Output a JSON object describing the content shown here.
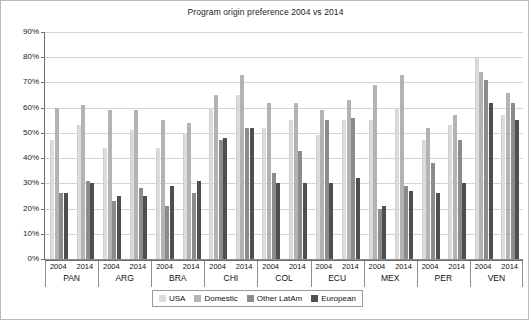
{
  "chart_data": {
    "type": "bar",
    "title": "Program origin preference 2004 vs 2014",
    "xlabel": "",
    "ylabel": "",
    "ylim": [
      0,
      90
    ],
    "ytick_labels": [
      "0%",
      "10%",
      "20%",
      "30%",
      "40%",
      "50%",
      "60%",
      "70%",
      "80%",
      "90%"
    ],
    "ytick_values": [
      0,
      10,
      20,
      30,
      40,
      50,
      60,
      70,
      80,
      90
    ],
    "grid": true,
    "legend_position": "bottom",
    "legend": [
      "USA",
      "Domestic",
      "Other LatAm",
      "European"
    ],
    "series_colors": [
      "#dcdcdc",
      "#b3b3b3",
      "#8c8c8c",
      "#4f4f4f"
    ],
    "categories": [
      "PAN",
      "ARG",
      "BRA",
      "CHI",
      "COL",
      "ECU",
      "MEX",
      "PER",
      "VEN"
    ],
    "years": [
      "2004",
      "2014"
    ],
    "series": [
      {
        "name": "USA",
        "values_2004": [
          47,
          44,
          44,
          60,
          52,
          49,
          55,
          47,
          80
        ],
        "values_2014": [
          53,
          51,
          50,
          65,
          55,
          55,
          60,
          53,
          57
        ]
      },
      {
        "name": "Domestic",
        "values_2004": [
          60,
          59,
          55,
          65,
          62,
          59,
          69,
          52,
          74
        ],
        "values_2014": [
          61,
          59,
          54,
          73,
          62,
          63,
          73,
          57,
          66
        ]
      },
      {
        "name": "Other LatAm",
        "values_2004": [
          26,
          23,
          21,
          47,
          34,
          55,
          20,
          38,
          71
        ],
        "values_2014": [
          31,
          28,
          26,
          52,
          43,
          56,
          29,
          47,
          62
        ]
      },
      {
        "name": "European",
        "values_2004": [
          26,
          25,
          29,
          48,
          30,
          30,
          21,
          26,
          62
        ],
        "values_2014": [
          30,
          25,
          31,
          52,
          30,
          32,
          27,
          30,
          55
        ]
      }
    ]
  }
}
